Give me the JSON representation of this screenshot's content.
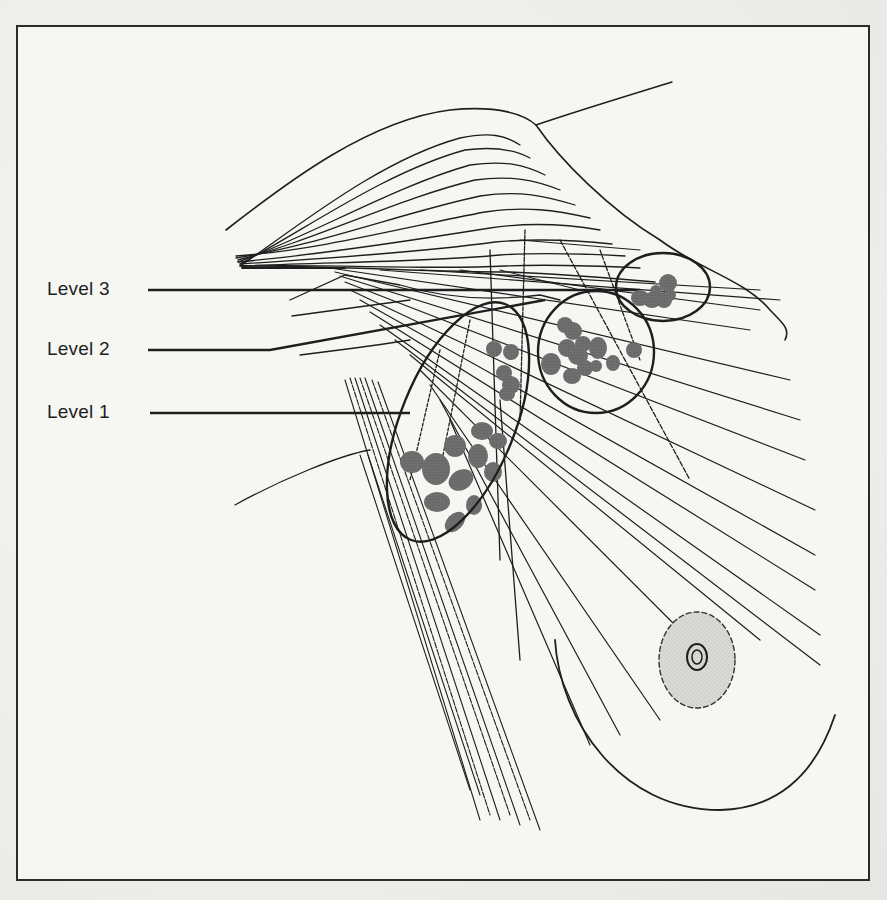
{
  "figure": {
    "frame_color": "#2b2b2b",
    "node_color": "#6e6e6e",
    "line_color": "#1e1e1e",
    "areola_fill": "#d6d6d2"
  },
  "labels": [
    {
      "id": "level-3",
      "text": "Level 3",
      "x": 47,
      "y": 279,
      "leader_end_x": 640,
      "leader_y": 291
    },
    {
      "id": "level-2",
      "text": "Level 2",
      "x": 47,
      "y": 339,
      "leader_end_x": 560,
      "leader_y": 351
    },
    {
      "id": "level-1",
      "text": "Level 1",
      "x": 47,
      "y": 402,
      "leader_end_x": 410,
      "leader_y": 414
    }
  ],
  "node_groups": [
    {
      "level": "Level 3",
      "ellipse": {
        "cx": 663,
        "cy": 288,
        "rx": 47,
        "ry": 34
      },
      "node_count": 6
    },
    {
      "level": "Level 2",
      "ellipse": {
        "cx": 596,
        "cy": 355,
        "rx": 57,
        "ry": 57
      },
      "node_count": 12
    },
    {
      "level": "Level 1",
      "ellipse": {
        "cx": 468,
        "cy": 422,
        "rx": 60,
        "ry": 128,
        "rotate": 22
      },
      "node_count": 16
    }
  ]
}
